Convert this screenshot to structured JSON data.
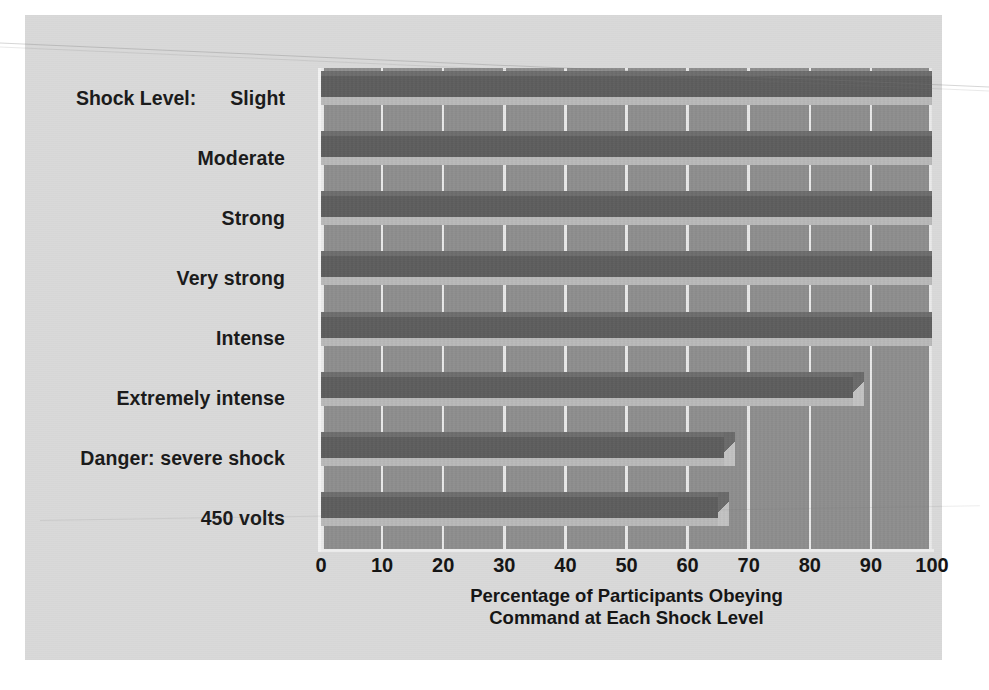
{
  "chart_data": {
    "type": "bar",
    "orientation": "horizontal",
    "title": "",
    "xlabel": "Percentage of Participants Obeying Command at Each Shock Level",
    "xlabel_line1": "Percentage of Participants Obeying",
    "xlabel_line2": "Command at Each Shock Level",
    "ylabel": "Shock Level:",
    "categories": [
      "Slight",
      "Moderate",
      "Strong",
      "Very strong",
      "Intense",
      "Extremely intense",
      "Danger: severe shock",
      "450 volts"
    ],
    "values": [
      100,
      100,
      100,
      100,
      100,
      87,
      66,
      65
    ],
    "xlim": [
      0,
      100
    ],
    "xticks": [
      0,
      10,
      20,
      30,
      40,
      50,
      60,
      70,
      80,
      90,
      100
    ],
    "xtick_labels": [
      "0",
      "10",
      "20",
      "30",
      "40",
      "50",
      "60",
      "70",
      "80",
      "90",
      "100"
    ],
    "grid": true,
    "grid_axis": "x",
    "legend": "none",
    "style": "3d-bar",
    "colors": {
      "card_background": "#d9d9d9",
      "plot_background": "#8e8e8e",
      "bar_face": "#5d5d5d",
      "bar_bevel": "#b9b9b9",
      "gridline": "#e9e9e9",
      "text": "#141414"
    }
  }
}
